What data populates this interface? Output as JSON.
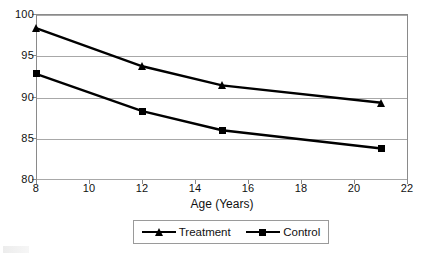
{
  "chart_data": {
    "type": "line",
    "title": "",
    "subtitle": "",
    "xlabel": "Age (Years)",
    "ylabel": "",
    "x": [
      8,
      12,
      15,
      21
    ],
    "xlim": [
      8,
      22
    ],
    "ylim": [
      80,
      100
    ],
    "xticks": [
      8,
      10,
      12,
      14,
      16,
      18,
      20,
      22
    ],
    "yticks": [
      80,
      85,
      90,
      95,
      100
    ],
    "xtick_labels": [
      "8",
      "10",
      "12",
      "14",
      "16",
      "18",
      "20",
      "22"
    ],
    "ytick_labels": [
      "80",
      "85",
      "90",
      "95",
      "100"
    ],
    "grid": "horizontal",
    "legend_position": "bottom",
    "line_color": "#000000",
    "grid_color": "#a8a8a8",
    "frame_color": "#8a8a8a",
    "background": "#ffffff",
    "series": [
      {
        "name": "Treatment",
        "marker": "triangle",
        "values": [
          98.3,
          93.7,
          91.4,
          89.3
        ]
      },
      {
        "name": "Control",
        "marker": "square",
        "values": [
          92.8,
          88.3,
          86.0,
          83.8
        ]
      }
    ]
  },
  "legend": {
    "entries": [
      {
        "label": "Treatment",
        "marker": "triangle-marker"
      },
      {
        "label": "Control",
        "marker": "square-marker"
      }
    ]
  }
}
